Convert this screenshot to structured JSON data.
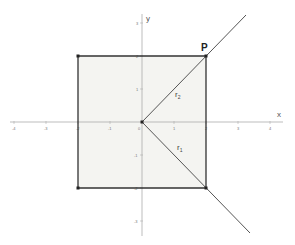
{
  "diagram": {
    "type": "coordinate-geometry",
    "axes": {
      "x_label": "x",
      "y_label": "y",
      "x_ticks": [
        "-4",
        "-3",
        "-2",
        "-1",
        "0",
        "1",
        "2",
        "3",
        "4"
      ],
      "y_ticks": [
        "3",
        "2",
        "1",
        "-1",
        "-2",
        "-3"
      ]
    },
    "square": {
      "vertices": [
        [
          -2,
          2
        ],
        [
          2,
          2
        ],
        [
          2,
          -2
        ],
        [
          -2,
          -2
        ]
      ],
      "fill": "#f4f4f1",
      "stroke": "#333333"
    },
    "rays": [
      {
        "name": "r2",
        "label": "r",
        "subscript": "2",
        "from": [
          0,
          0
        ],
        "through": [
          2,
          2
        ]
      },
      {
        "name": "r1",
        "label": "r",
        "subscript": "1",
        "from": [
          0,
          0
        ],
        "through": [
          2,
          -2
        ]
      }
    ],
    "points": [
      {
        "name": "P",
        "label": "P",
        "coords": [
          2,
          2
        ]
      }
    ],
    "colors": {
      "axis": "#999999",
      "ray": "#555555",
      "square_edge": "#333333",
      "vertex": "#222222"
    }
  }
}
